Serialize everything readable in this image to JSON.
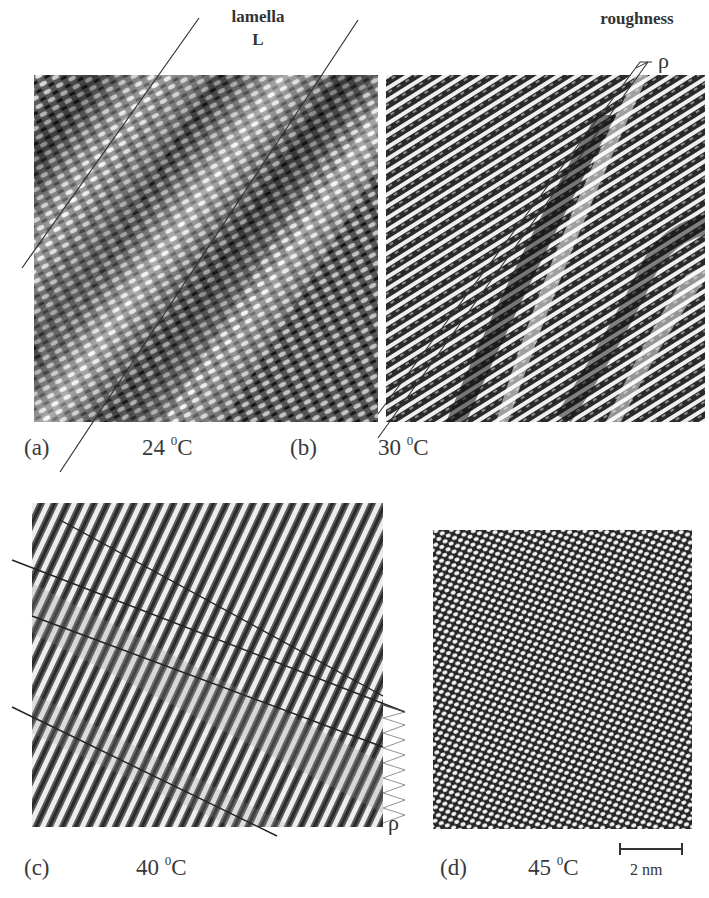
{
  "figure": {
    "annotations": {
      "lamella": "lamella",
      "lamella_symbol": "L",
      "roughness": "roughness",
      "roughness_symbol_b": "ρ",
      "roughness_symbol_c": "ρ"
    },
    "panels": [
      {
        "id": "a",
        "label": "(a)",
        "temperature": "24",
        "unit": "C",
        "degree": "0",
        "texture": "crosshatch-lamellae"
      },
      {
        "id": "b",
        "label": "(b)",
        "temperature": "30",
        "unit": "C",
        "degree": "0",
        "texture": "diagonal-stripes-with-boundaries"
      },
      {
        "id": "c",
        "label": "(c)",
        "temperature": "40",
        "unit": "C",
        "degree": "0",
        "texture": "steep-stripes"
      },
      {
        "id": "d",
        "label": "(d)",
        "temperature": "45",
        "unit": "C",
        "degree": "0",
        "texture": "hexagonal-dots"
      }
    ],
    "scale_bar": {
      "label": "2 nm"
    },
    "colors": {
      "background": "#ffffff",
      "ink": "#2a2a2a",
      "image_dark": "#1e1e1e",
      "image_light": "#f2f2f2"
    }
  }
}
